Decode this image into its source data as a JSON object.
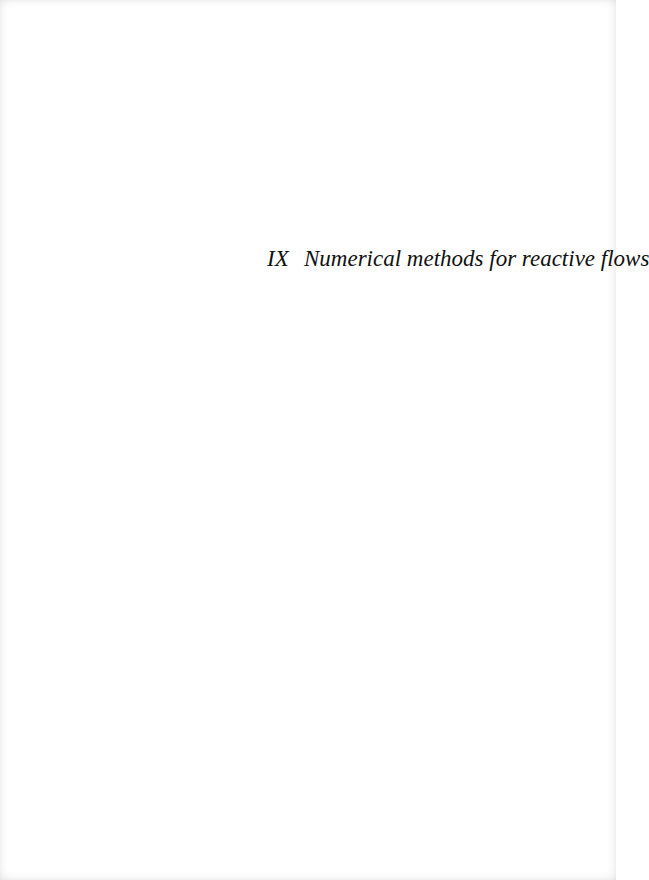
{
  "page": {
    "type": "part-title-page",
    "background_color": "#ffffff",
    "text_color": "#111111"
  },
  "part": {
    "number": "IX",
    "title": "Numerical methods for reactive flows"
  }
}
